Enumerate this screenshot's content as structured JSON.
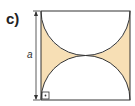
{
  "label": "c)",
  "dimension_label": "a",
  "colors": {
    "fill": "#f7dfb5",
    "stroke": "#222222"
  }
}
